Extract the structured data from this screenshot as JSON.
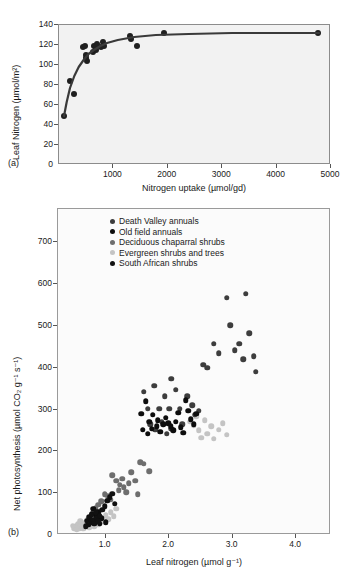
{
  "figure": {
    "panel_a_label": "(a)",
    "panel_b_label": "(b)"
  },
  "chart_data": [
    {
      "id": "panel_a",
      "type": "scatter",
      "title": "",
      "xlabel": "Nitrogen uptake (µmol/gd)",
      "ylabel": "Leaf Nitrogen (µmol/m²)",
      "xlim": [
        0,
        5000
      ],
      "ylim": [
        0,
        140
      ],
      "xticks": [
        0,
        1000,
        2000,
        3000,
        4000,
        5000
      ],
      "xtick_labels": [
        "0",
        "1000",
        "2000",
        "3000",
        "4000",
        "5000"
      ],
      "yticks": [
        0,
        20,
        40,
        60,
        80,
        100,
        120,
        140
      ],
      "ytick_labels": [
        "0",
        "20",
        "40",
        "60",
        "80",
        "100",
        "120",
        "140"
      ],
      "grid": false,
      "legend": "none",
      "background": "#f2f2f2",
      "marker_color": "#1f1f1f",
      "fit_line": {
        "style": "saturating-curve",
        "color": "#3a3a3a",
        "width": 2.2,
        "points": [
          [
            110,
            48
          ],
          [
            160,
            62
          ],
          [
            220,
            76
          ],
          [
            300,
            88
          ],
          [
            380,
            97
          ],
          [
            470,
            104
          ],
          [
            560,
            110
          ],
          [
            660,
            114
          ],
          [
            780,
            118
          ],
          [
            900,
            121
          ],
          [
            1100,
            124
          ],
          [
            1400,
            127
          ],
          [
            1800,
            129
          ],
          [
            2400,
            130
          ],
          [
            3200,
            131
          ],
          [
            4000,
            131
          ],
          [
            4800,
            131
          ]
        ]
      },
      "points": [
        [
          115,
          48
        ],
        [
          225,
          83
        ],
        [
          300,
          70
        ],
        [
          460,
          117
        ],
        [
          500,
          118
        ],
        [
          510,
          106
        ],
        [
          520,
          109
        ],
        [
          530,
          103
        ],
        [
          640,
          112
        ],
        [
          660,
          118
        ],
        [
          690,
          117
        ],
        [
          700,
          114
        ],
        [
          720,
          120
        ],
        [
          790,
          117
        ],
        [
          830,
          122
        ],
        [
          840,
          118
        ],
        [
          1320,
          128
        ],
        [
          1350,
          125
        ],
        [
          1460,
          118
        ],
        [
          1950,
          131
        ],
        [
          4780,
          131
        ]
      ]
    },
    {
      "id": "panel_b",
      "type": "scatter",
      "title": "",
      "xlabel": "Leaf nitrogen (µmol g⁻¹)",
      "ylabel": "Net photosynthesis (µmol CO₂ g⁻¹ s⁻¹)",
      "xlim": [
        0.25,
        4.55
      ],
      "ylim": [
        0,
        780
      ],
      "xticks": [
        1.0,
        2.0,
        3.0,
        4.0
      ],
      "xtick_labels": [
        "1.0",
        "2.0",
        "3.0",
        "4.0"
      ],
      "yticks": [
        0,
        100,
        200,
        300,
        400,
        500,
        600,
        700
      ],
      "ytick_labels": [
        "0",
        "100",
        "200",
        "300",
        "400",
        "500",
        "600",
        "700"
      ],
      "grid": false,
      "legend_position": "upper-left-inside",
      "background": "#fbfbfb",
      "series": [
        {
          "name": "Death Valley annuals",
          "color": "#3d3d3d",
          "points": [
            [
              1.62,
              340
            ],
            [
              1.68,
              300
            ],
            [
              1.78,
              355
            ],
            [
              1.86,
              300
            ],
            [
              1.72,
              262
            ],
            [
              1.8,
              250
            ],
            [
              1.9,
              268
            ],
            [
              1.95,
              330
            ],
            [
              2.02,
              300
            ],
            [
              2.05,
              372
            ],
            [
              2.12,
              345
            ],
            [
              2.18,
              300
            ],
            [
              2.22,
              262
            ],
            [
              2.3,
              330
            ],
            [
              2.38,
              308
            ],
            [
              2.42,
              285
            ],
            [
              2.05,
              252
            ],
            [
              1.98,
              240
            ],
            [
              2.48,
              295
            ],
            [
              2.55,
              405
            ],
            [
              2.62,
              398
            ],
            [
              2.72,
              455
            ],
            [
              2.8,
              432
            ],
            [
              2.92,
              565
            ],
            [
              2.98,
              500
            ],
            [
              3.05,
              440
            ],
            [
              3.12,
              455
            ],
            [
              3.18,
              418
            ],
            [
              3.22,
              575
            ],
            [
              3.28,
              480
            ],
            [
              3.35,
              425
            ],
            [
              3.38,
              388
            ]
          ]
        },
        {
          "name": "Old field annuals",
          "color": "#0d0d0d",
          "points": [
            [
              1.58,
              288
            ],
            [
              1.65,
              318
            ],
            [
              1.7,
              268
            ],
            [
              1.74,
              252
            ],
            [
              1.82,
              258
            ],
            [
              1.88,
              245
            ],
            [
              1.92,
              262
            ],
            [
              1.96,
              278
            ],
            [
              2.0,
              265
            ],
            [
              2.04,
              258
            ],
            [
              2.08,
              248
            ],
            [
              2.12,
              268
            ],
            [
              2.16,
              290
            ],
            [
              2.2,
              255
            ],
            [
              2.24,
              242
            ],
            [
              2.28,
              320
            ],
            [
              2.32,
              295
            ],
            [
              2.36,
              275
            ],
            [
              1.76,
              285
            ],
            [
              1.84,
              272
            ],
            [
              2.4,
              262
            ],
            [
              2.44,
              288
            ],
            [
              1.6,
              250
            ],
            [
              1.68,
              240
            ],
            [
              0.82,
              60
            ],
            [
              0.86,
              45
            ],
            [
              0.9,
              52
            ],
            [
              0.95,
              38
            ],
            [
              0.8,
              48
            ],
            [
              0.88,
              30
            ],
            [
              1.02,
              28
            ],
            [
              0.92,
              25
            ]
          ]
        },
        {
          "name": "Deciduous chaparral shrubs",
          "color": "#6e6e6e",
          "points": [
            [
              1.12,
              140
            ],
            [
              1.18,
              128
            ],
            [
              1.24,
              118
            ],
            [
              1.28,
              132
            ],
            [
              1.22,
              105
            ],
            [
              1.3,
              112
            ],
            [
              1.34,
              100
            ],
            [
              1.38,
              122
            ],
            [
              1.05,
              90
            ],
            [
              1.1,
              82
            ],
            [
              1.0,
              95
            ],
            [
              0.95,
              78
            ],
            [
              0.9,
              70
            ],
            [
              0.86,
              62
            ],
            [
              1.42,
              148
            ],
            [
              1.48,
              128
            ],
            [
              1.52,
              95
            ],
            [
              1.56,
              172
            ],
            [
              0.84,
              55
            ],
            [
              0.8,
              48
            ],
            [
              1.62,
              168
            ],
            [
              1.7,
              150
            ]
          ]
        },
        {
          "name": "Evergreen shrubs and trees",
          "color": "#c4c4c4",
          "points": [
            [
              0.55,
              18
            ],
            [
              0.58,
              24
            ],
            [
              0.6,
              14
            ],
            [
              0.62,
              30
            ],
            [
              0.64,
              20
            ],
            [
              0.66,
              12
            ],
            [
              0.68,
              26
            ],
            [
              0.7,
              18
            ],
            [
              0.72,
              34
            ],
            [
              0.74,
              22
            ],
            [
              0.76,
              16
            ],
            [
              0.78,
              28
            ],
            [
              0.8,
              36
            ],
            [
              0.82,
              24
            ],
            [
              0.84,
              18
            ],
            [
              0.86,
              42
            ],
            [
              0.88,
              30
            ],
            [
              0.9,
              22
            ],
            [
              0.94,
              38
            ],
            [
              0.98,
              30
            ],
            [
              1.02,
              45
            ],
            [
              1.06,
              35
            ],
            [
              1.1,
              52
            ],
            [
              1.14,
              42
            ],
            [
              1.18,
              60
            ],
            [
              0.52,
              14
            ],
            [
              0.5,
              20
            ],
            [
              0.56,
              10
            ],
            [
              2.4,
              260
            ],
            [
              2.48,
              248
            ],
            [
              2.52,
              230
            ],
            [
              2.58,
              272
            ],
            [
              2.62,
              240
            ],
            [
              2.68,
              258
            ],
            [
              2.72,
              228
            ],
            [
              2.8,
              250
            ],
            [
              2.86,
              265
            ],
            [
              2.92,
              238
            ],
            [
              2.35,
              268
            ],
            [
              2.44,
              282
            ]
          ]
        },
        {
          "name": "South African shrubs",
          "color": "#111111",
          "points": [
            [
              0.72,
              32
            ],
            [
              0.76,
              40
            ],
            [
              0.78,
              28
            ],
            [
              0.8,
              46
            ],
            [
              0.82,
              34
            ],
            [
              0.84,
              24
            ],
            [
              0.86,
              52
            ],
            [
              0.88,
              38
            ],
            [
              0.9,
              30
            ],
            [
              0.74,
              22
            ],
            [
              0.7,
              18
            ],
            [
              0.92,
              44
            ],
            [
              1.08,
              88
            ],
            [
              1.12,
              96
            ],
            [
              1.04,
              80
            ],
            [
              1.16,
              72
            ],
            [
              0.96,
              58
            ],
            [
              1.0,
              66
            ]
          ]
        }
      ]
    }
  ]
}
